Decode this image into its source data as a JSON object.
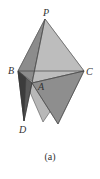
{
  "figure": {
    "caption": "(a)",
    "vertices": {
      "P": {
        "label": "P",
        "x": 45,
        "y": 19
      },
      "B": {
        "label": "B",
        "x": 18,
        "y": 71
      },
      "C": {
        "label": "C",
        "x": 84,
        "y": 71
      },
      "A": {
        "label": "A",
        "x": 32,
        "y": 83
      },
      "D": {
        "label": "D",
        "x": 24,
        "y": 121
      }
    },
    "colors": {
      "face_light": "#c4c4c4",
      "face_mid": "#9a9a9a",
      "face_dark": "#6e6e6e",
      "face_darkest": "#4a4a4a",
      "edge": "#444444",
      "label": "#333333"
    }
  }
}
